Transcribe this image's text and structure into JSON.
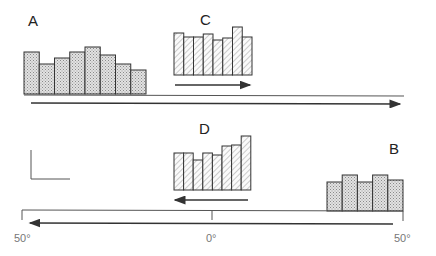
{
  "panels": {
    "A": {
      "label": "A",
      "pattern": "stipple",
      "x0": 24,
      "bar_width": 15.25,
      "baseline": 94,
      "tops": [
        52,
        64,
        58,
        52,
        47,
        55,
        64,
        70
      ]
    },
    "B": {
      "label": "B",
      "pattern": "stipple",
      "x0": 327,
      "bar_width": 15.2,
      "baseline": 211,
      "tops": [
        182,
        175,
        182,
        175,
        180
      ]
    },
    "C": {
      "label": "C",
      "pattern": "hatch",
      "x0": 174,
      "bar_width": 9.75,
      "baseline": 75,
      "tops": [
        33,
        37,
        37,
        34,
        40,
        38,
        27,
        37
      ],
      "arrow_direction": "right"
    },
    "D": {
      "label": "D",
      "pattern": "hatch",
      "x0": 174,
      "bar_width": 9.6,
      "baseline": 190,
      "tops": [
        153,
        153,
        160,
        153,
        155,
        146,
        145,
        136
      ],
      "arrow_direction": "left"
    }
  },
  "axis": {
    "tick_labels": [
      "50°",
      "0°",
      "50°"
    ]
  },
  "colors": {
    "stroke": "#333333",
    "stipple": "#bdbdbd",
    "hatch": "#999999"
  }
}
